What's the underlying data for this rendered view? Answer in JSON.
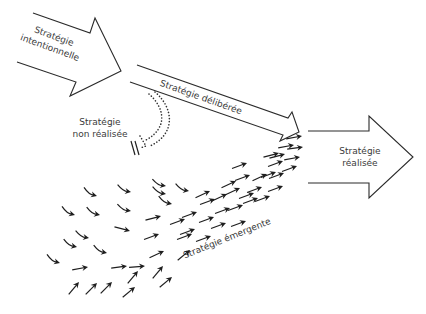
{
  "diagram": {
    "labels": {
      "intended": [
        "Stratégie",
        "intentionnelle"
      ],
      "deliberate": "Stratégie délibérée",
      "unrealized": [
        "Stratégie",
        "non réalisée"
      ],
      "realized": [
        "Stratégie",
        "réalisée"
      ],
      "emergent": "Stratégie émergente"
    },
    "icons": {
      "intended_arrow": "big-block-arrow",
      "deliberate_arrow": "thin-block-arrow",
      "realized_arrow": "big-block-arrow",
      "unrealized_path": "dotted-curved-arrow",
      "unrealized_stop": "double-slash",
      "emergent_flow": "small-arrows"
    },
    "colors": {
      "line": "#2b2b2b",
      "text": "#3a3a3a",
      "background": "#ffffff"
    }
  }
}
